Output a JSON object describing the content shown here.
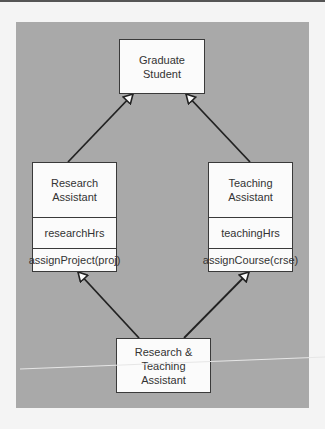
{
  "diagram": {
    "type": "UML class inheritance (diamond)",
    "classes": {
      "graduate_student": {
        "name": [
          "Graduate",
          "Student"
        ]
      },
      "research_assistant": {
        "name": [
          "Research",
          "Assistant"
        ],
        "attribute": "researchHrs",
        "operation": "assignProject(proj)"
      },
      "teaching_assistant": {
        "name": [
          "Teaching",
          "Assistant"
        ],
        "attribute": "teachingHrs",
        "operation": "assignCourse(crse)"
      },
      "research_teaching_assistant": {
        "name": [
          "Research & Teaching",
          "Assistant"
        ]
      }
    },
    "relationships": [
      {
        "from": "Research Assistant",
        "to": "Graduate Student",
        "type": "generalization"
      },
      {
        "from": "Teaching Assistant",
        "to": "Graduate Student",
        "type": "generalization"
      },
      {
        "from": "Research & Teaching Assistant",
        "to": "Research Assistant",
        "type": "generalization"
      },
      {
        "from": "Research & Teaching Assistant",
        "to": "Teaching Assistant",
        "type": "generalization"
      }
    ],
    "colors": {
      "panel": "#a9a9a9",
      "box": "#fbfbfb",
      "line": "#222222",
      "page": "#f4f4f4"
    }
  }
}
